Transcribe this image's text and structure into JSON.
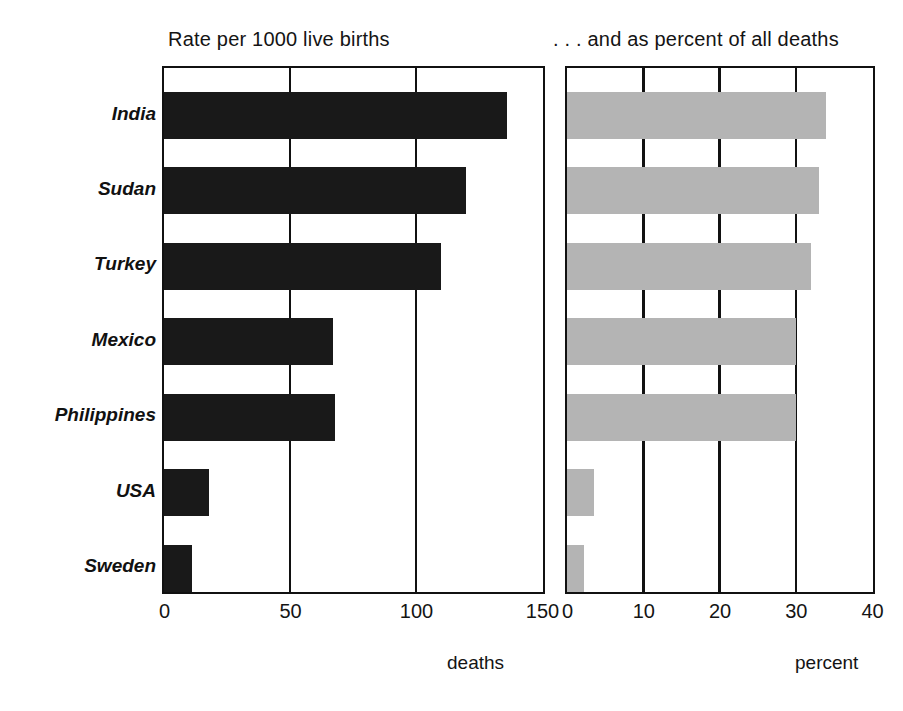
{
  "chart_data": {
    "type": "bar",
    "orientation": "horizontal",
    "title": "",
    "categories": [
      "India",
      "Sudan",
      "Turkey",
      "Mexico",
      "Philippines",
      "USA",
      "Sweden"
    ],
    "panels": [
      {
        "title": "Rate per 1000 live births",
        "xlabel": "deaths",
        "values": [
          136,
          120,
          110,
          67,
          68,
          18,
          11
        ],
        "xlim": [
          0,
          150
        ],
        "ticks": [
          0,
          50,
          100,
          150
        ],
        "tick_labels": [
          "0",
          "50",
          "100",
          "150"
        ],
        "bar_color": "#191919",
        "grid": true
      },
      {
        "title": ". . . and as percent of all deaths",
        "xlabel": "percent",
        "values": [
          34,
          33,
          32,
          30,
          30,
          3.5,
          2.2
        ],
        "xlim": [
          0,
          40
        ],
        "ticks": [
          0,
          10,
          20,
          30,
          40
        ],
        "tick_labels": [
          "0",
          "10",
          "20",
          "30",
          "40"
        ],
        "bar_color": "#b4b4b4",
        "grid": true
      }
    ],
    "ylabel": "",
    "legend": "none"
  },
  "caption": ""
}
